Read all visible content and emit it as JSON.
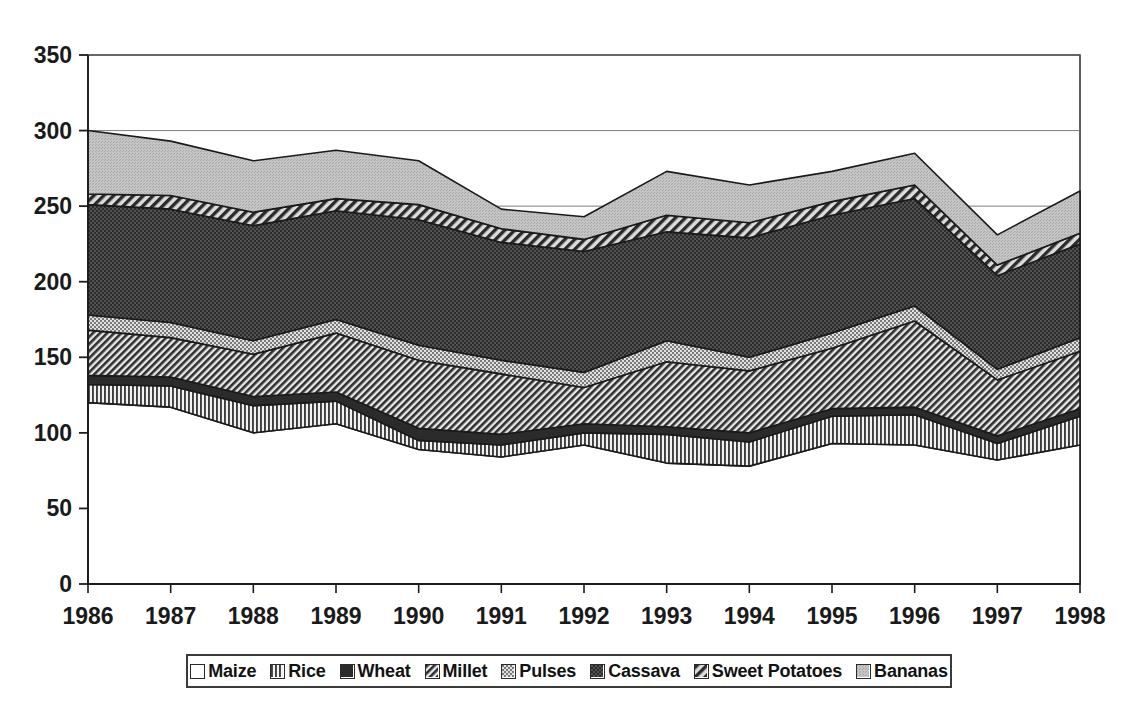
{
  "chart_data": {
    "type": "area",
    "stacked": true,
    "title": "",
    "xlabel": "",
    "ylabel": "",
    "x": [
      1986,
      1987,
      1988,
      1989,
      1990,
      1991,
      1992,
      1993,
      1994,
      1995,
      1996,
      1997,
      1998
    ],
    "categories": [
      "1986",
      "1987",
      "1988",
      "1989",
      "1990",
      "1991",
      "1992",
      "1993",
      "1994",
      "1995",
      "1996",
      "1997",
      "1998"
    ],
    "yticks": [
      0,
      50,
      100,
      150,
      200,
      250,
      300,
      350
    ],
    "ylim": [
      0,
      350
    ],
    "grid": true,
    "legend_position": "bottom",
    "series": [
      {
        "name": "Maize",
        "swatch": "white-empty",
        "color": "#ffffff",
        "values": [
          120,
          117,
          100,
          106,
          89,
          84,
          92,
          80,
          78,
          93,
          92,
          82,
          92
        ]
      },
      {
        "name": "Rice",
        "swatch": "vertical-stripes",
        "color": "#808080",
        "values": [
          12,
          14,
          18,
          15,
          6,
          8,
          8,
          19,
          16,
          18,
          20,
          11,
          19
        ]
      },
      {
        "name": "Wheat",
        "swatch": "solid-dark",
        "color": "#2e2e2e",
        "values": [
          6,
          6,
          6,
          6,
          8,
          7,
          6,
          5,
          6,
          5,
          5,
          5,
          5
        ]
      },
      {
        "name": "Millet",
        "swatch": "diagonal-hatch",
        "color": "#5a5a5a",
        "values": [
          30,
          26,
          28,
          39,
          45,
          40,
          24,
          43,
          41,
          40,
          57,
          37,
          38
        ]
      },
      {
        "name": "Pulses",
        "swatch": "light-checker",
        "color": "#a8a8a8",
        "values": [
          10,
          10,
          9,
          9,
          10,
          9,
          10,
          14,
          9,
          10,
          10,
          7,
          9
        ]
      },
      {
        "name": "Cassava",
        "swatch": "dark-dots",
        "color": "#3a3a3a",
        "values": [
          73,
          75,
          76,
          72,
          83,
          78,
          80,
          72,
          79,
          78,
          71,
          62,
          62
        ]
      },
      {
        "name": "Sweet Potatoes",
        "swatch": "coarse-hatch",
        "color": "#4e4e4e",
        "values": [
          7,
          9,
          9,
          8,
          10,
          9,
          8,
          11,
          10,
          9,
          9,
          7,
          7
        ]
      },
      {
        "name": "Bananas",
        "swatch": "light-gray",
        "color": "#bdbdbd",
        "values": [
          42,
          36,
          34,
          32,
          29,
          13,
          15,
          29,
          25,
          20,
          21,
          20,
          28
        ]
      }
    ],
    "totals": [
      300,
      273,
      270,
      267,
      280,
      248,
      243,
      273,
      264,
      273,
      285,
      231,
      260
    ]
  },
  "axis": {
    "y_labels": [
      "350",
      "300",
      "250",
      "200",
      "150",
      "100",
      "50",
      "0"
    ],
    "x_labels": [
      "1986",
      "1987",
      "1988",
      "1989",
      "1990",
      "1991",
      "1992",
      "1993",
      "1994",
      "1995",
      "1996",
      "1997",
      "1998"
    ]
  },
  "legend": {
    "items": [
      {
        "label": "Maize",
        "swatch": "maize"
      },
      {
        "label": "Rice",
        "swatch": "rice"
      },
      {
        "label": "Wheat",
        "swatch": "wheat"
      },
      {
        "label": "Millet",
        "swatch": "millet"
      },
      {
        "label": "Pulses",
        "swatch": "pulses"
      },
      {
        "label": "Cassava",
        "swatch": "cassava"
      },
      {
        "label": "Sweet Potatoes",
        "swatch": "sweet-potatoes"
      },
      {
        "label": "Bananas",
        "swatch": "bananas"
      }
    ]
  }
}
